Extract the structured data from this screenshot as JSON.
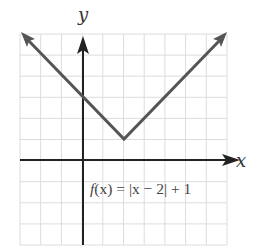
{
  "chart_data": {
    "type": "line",
    "title": "",
    "function_label": "f(x) = |x − 2| + 1",
    "xlabel": "x",
    "ylabel": "y",
    "xlim": [
      -3,
      7
    ],
    "ylim": [
      -4,
      6
    ],
    "grid": true,
    "grid_step": 1,
    "tick_labels_shown": false,
    "series": [
      {
        "name": "f(x) = |x - 2| + 1",
        "x": [
          -3,
          2,
          7
        ],
        "y": [
          6,
          1,
          6
        ],
        "arrows_at_ends": true,
        "color": "#555555"
      }
    ],
    "vertex": {
      "x": 2,
      "y": 1
    }
  },
  "labels": {
    "x_axis": "x",
    "y_axis": "y",
    "equation_f": "f",
    "equation_rest": "(x) = |x − 2| + 1"
  },
  "colors": {
    "grid": "#dcdcdc",
    "axis": "#222222",
    "curve": "#555555"
  }
}
